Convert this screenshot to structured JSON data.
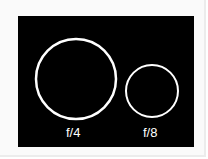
{
  "diagram": {
    "background": "#000000",
    "stroke": "#ffffff",
    "apertures": [
      {
        "label": "f/4",
        "cx": 76,
        "cy": 79,
        "r": 40
      },
      {
        "label": "f/8",
        "cx": 152,
        "cy": 91,
        "r": 26
      }
    ]
  }
}
